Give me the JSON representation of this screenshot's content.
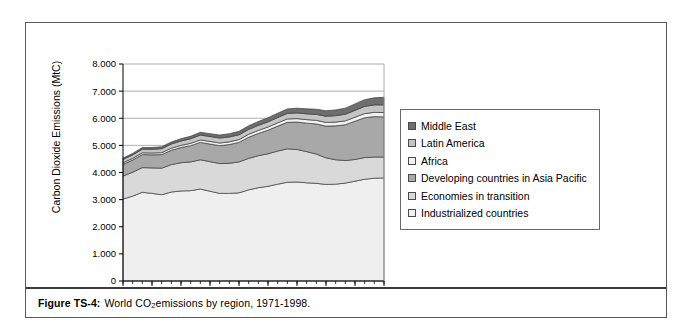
{
  "figure": {
    "caption_label": "Figure TS-4:",
    "caption_text_before": "World CO",
    "caption_subscript": "2",
    "caption_text_after": " emissions by region, 1971-1998."
  },
  "legend": {
    "position": "right",
    "items": [
      {
        "label": "Middle East",
        "color": "#6e6e6e"
      },
      {
        "label": "Latin America",
        "color": "#c4c4c4"
      },
      {
        "label": "Africa",
        "color": "#f2f2f2"
      },
      {
        "label": "Developing countries in Asia Pacific",
        "color": "#a8a8a8"
      },
      {
        "label": "Economies in transition",
        "color": "#d9d9d9"
      },
      {
        "label": "Industrialized countries",
        "color": "#efefef"
      }
    ]
  },
  "chart_data": {
    "type": "area",
    "stacked": true,
    "title": "",
    "xlabel": "",
    "ylabel": "Carbon Dioxide Emissions (MtC)",
    "ylim": [
      0,
      8000
    ],
    "ytick_values": [
      0,
      1000,
      2000,
      3000,
      4000,
      5000,
      6000,
      7000,
      8000
    ],
    "ytick_labels": [
      "0",
      "1.000",
      "2.000",
      "3.000",
      "4.000",
      "5.000",
      "6.000",
      "7.000",
      "8.000"
    ],
    "grid": true,
    "grid_axis": "y",
    "x": [
      1971,
      1972,
      1973,
      1974,
      1975,
      1976,
      1977,
      1978,
      1979,
      1980,
      1981,
      1982,
      1983,
      1984,
      1985,
      1986,
      1987,
      1988,
      1989,
      1990,
      1991,
      1992,
      1993,
      1994,
      1995,
      1996,
      1997,
      1998
    ],
    "xtick_labels": [
      "1971",
      "1974",
      "1977",
      "1980",
      "1983",
      "1986",
      "1989",
      "1992",
      "1995",
      "1998"
    ],
    "xtick_values": [
      1971,
      1974,
      1977,
      1980,
      1983,
      1986,
      1989,
      1992,
      1995,
      1998
    ],
    "xtick_minor_every": 1,
    "series": [
      {
        "name": "Industrialized countries",
        "color": "#efefef",
        "values": [
          3020,
          3130,
          3270,
          3230,
          3180,
          3280,
          3320,
          3330,
          3390,
          3310,
          3230,
          3230,
          3250,
          3360,
          3440,
          3490,
          3570,
          3640,
          3650,
          3620,
          3600,
          3560,
          3570,
          3610,
          3680,
          3750,
          3790,
          3800
        ]
      },
      {
        "name": "Economies in transition",
        "color": "#d9d9d9",
        "values": [
          850,
          880,
          910,
          940,
          980,
          1010,
          1040,
          1060,
          1080,
          1090,
          1100,
          1110,
          1140,
          1160,
          1180,
          1200,
          1220,
          1230,
          1200,
          1150,
          1080,
          980,
          900,
          830,
          800,
          800,
          780,
          770
        ]
      },
      {
        "name": "Developing countries in Asia Pacific",
        "color": "#a8a8a8",
        "values": [
          430,
          450,
          480,
          480,
          500,
          530,
          560,
          600,
          640,
          650,
          660,
          690,
          720,
          780,
          820,
          870,
          920,
          980,
          1010,
          1050,
          1110,
          1170,
          1250,
          1320,
          1410,
          1470,
          1490,
          1480
        ]
      },
      {
        "name": "Africa",
        "color": "#f2f2f2",
        "values": [
          60,
          62,
          66,
          68,
          72,
          76,
          80,
          85,
          90,
          95,
          98,
          100,
          103,
          108,
          112,
          116,
          120,
          124,
          127,
          130,
          133,
          136,
          139,
          143,
          148,
          152,
          156,
          160
        ]
      },
      {
        "name": "Latin America",
        "color": "#c4c4c4",
        "values": [
          120,
          126,
          134,
          140,
          146,
          154,
          162,
          170,
          180,
          182,
          184,
          182,
          178,
          182,
          186,
          192,
          198,
          204,
          210,
          214,
          220,
          228,
          236,
          246,
          254,
          266,
          276,
          284
        ]
      },
      {
        "name": "Middle East",
        "color": "#6e6e6e",
        "values": [
          50,
          55,
          60,
          64,
          70,
          76,
          84,
          92,
          100,
          104,
          110,
          118,
          126,
          134,
          142,
          150,
          158,
          166,
          174,
          182,
          190,
          200,
          212,
          224,
          236,
          248,
          262,
          276
        ]
      }
    ],
    "totals": [
      4530,
      4703,
      4920,
      4922,
      4948,
      5126,
      5246,
      5337,
      5480,
      5431,
      5382,
      5430,
      5517,
      5724,
      5880,
      6018,
      6188,
      6344,
      6371,
      6346,
      6333,
      6274,
      6307,
      6373,
      6528,
      6686,
      6754,
      6770
    ]
  }
}
